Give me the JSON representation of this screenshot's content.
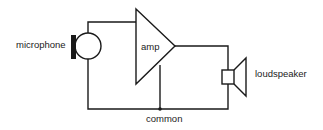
{
  "diagram": {
    "type": "circuit-block-diagram",
    "components": [
      {
        "id": "microphone",
        "label": "microphone"
      },
      {
        "id": "amp",
        "label": "amp"
      },
      {
        "id": "loudspeaker",
        "label": "loudspeaker"
      }
    ],
    "nodes": [
      {
        "id": "common",
        "label": "common"
      }
    ],
    "connections": [
      [
        "microphone",
        "amp"
      ],
      [
        "amp",
        "loudspeaker"
      ],
      [
        "microphone",
        "common"
      ],
      [
        "amp",
        "common"
      ],
      [
        "loudspeaker",
        "common"
      ]
    ],
    "labels": {
      "microphone": "microphone",
      "amp": "amp",
      "loudspeaker": "loudspeaker",
      "common": "common"
    },
    "colors": {
      "line": "#1a1a1a",
      "background": "#ffffff"
    }
  }
}
